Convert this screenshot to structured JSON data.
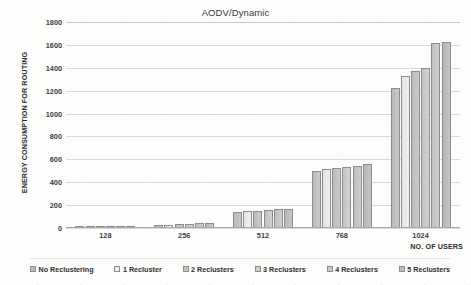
{
  "chart_data": {
    "type": "bar",
    "title": "AODV/Dynamic",
    "xlabel": "NO. OF USERS",
    "ylabel": "ENERGY CONSUMPTION FOR ROUTING",
    "categories": [
      "128",
      "256",
      "512",
      "768",
      "1024"
    ],
    "ylim": [
      0,
      1800
    ],
    "yticks": [
      0,
      200,
      400,
      600,
      800,
      1000,
      1200,
      1400,
      1600,
      1800
    ],
    "grid": true,
    "legend_position": "bottom",
    "series": [
      {
        "name": "No Reclustering",
        "values": [
          5,
          25,
          140,
          500,
          1225
        ]
      },
      {
        "name": "1 Recluster",
        "values": [
          6,
          30,
          148,
          515,
          1325
        ]
      },
      {
        "name": "2 Reclusters",
        "values": [
          7,
          34,
          152,
          527,
          1368
        ]
      },
      {
        "name": "3 Reclusters",
        "values": [
          8,
          38,
          158,
          537,
          1400
        ]
      },
      {
        "name": "4 Reclusters",
        "values": [
          9,
          42,
          164,
          545,
          1620
        ]
      },
      {
        "name": "5 Reclusters",
        "values": [
          10,
          46,
          168,
          558,
          1625
        ]
      }
    ]
  },
  "legend": {
    "items": [
      {
        "label": "No Reclustering"
      },
      {
        "label": "1 Recluster"
      },
      {
        "label": "2 Reclusters"
      },
      {
        "label": "3 Reclusters"
      },
      {
        "label": "4 Reclusters"
      },
      {
        "label": "5 Reclusters"
      }
    ]
  }
}
